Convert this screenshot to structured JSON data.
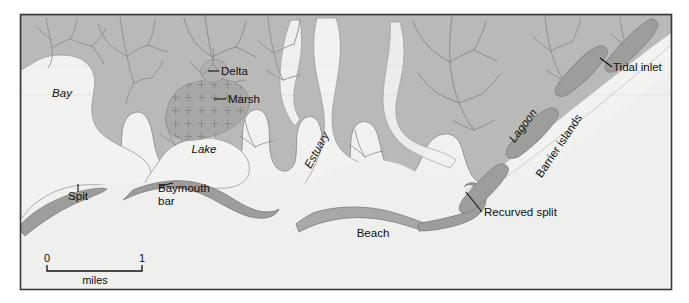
{
  "figure": {
    "frame": {
      "x": 20,
      "y": 14,
      "width": 652,
      "height": 276,
      "border_color": "#3a3a3a"
    }
  },
  "colors": {
    "water": "#f2f2f0",
    "land": "#b9b9b7",
    "land_edge": "#8e8e8c",
    "marsh": "#a4a4a2",
    "marsh_symbol": "#8a8a88",
    "bar_sand": "#9d9d9b",
    "bar_sand_edge": "#7e7e7c",
    "drainage": "#8d8d8b",
    "beach": "#a8a8a6",
    "label_text": "#101010",
    "leader_line": "#101010",
    "page_background": "#ffffff"
  },
  "labels": [
    {
      "id": "bay",
      "text": "Bay",
      "style": "italic",
      "x": 62,
      "y": 97,
      "rotate": 0,
      "anchor": "middle"
    },
    {
      "id": "lake",
      "text": "Lake",
      "style": "italic",
      "x": 204,
      "y": 153,
      "rotate": 0,
      "anchor": "middle"
    },
    {
      "id": "estuary",
      "text": "Estuary",
      "style": "italic",
      "x": 320,
      "y": 152,
      "rotate": -62,
      "anchor": "middle"
    },
    {
      "id": "lagoon",
      "text": "Lagoon",
      "style": "italic",
      "x": 526,
      "y": 128,
      "rotate": -53,
      "anchor": "middle"
    },
    {
      "id": "delta",
      "text": "Delta",
      "style": "regular",
      "x": 221,
      "y": 75,
      "rotate": 0,
      "anchor": "start"
    },
    {
      "id": "marsh",
      "text": "Marsh",
      "style": "regular",
      "x": 228,
      "y": 103,
      "rotate": 0,
      "anchor": "start"
    },
    {
      "id": "tidal-inlet",
      "text": "Tidal inlet",
      "style": "regular",
      "x": 613,
      "y": 71,
      "rotate": 0,
      "anchor": "start"
    },
    {
      "id": "barrier-islands",
      "text": "Barrier islands",
      "style": "regular",
      "x": 562,
      "y": 148,
      "rotate": -56,
      "anchor": "middle"
    },
    {
      "id": "recurved-split",
      "text": "Recurved split",
      "style": "regular",
      "x": 484,
      "y": 216,
      "rotate": 0,
      "anchor": "start"
    },
    {
      "id": "beach",
      "text": "Beach",
      "style": "regular",
      "x": 373,
      "y": 237,
      "rotate": 0,
      "anchor": "middle"
    },
    {
      "id": "spit",
      "text": "Spit",
      "style": "regular",
      "x": 78,
      "y": 200,
      "rotate": 0,
      "anchor": "middle"
    },
    {
      "id": "baymouth-bar-1",
      "text": "Baymouth",
      "style": "regular",
      "x": 158,
      "y": 192,
      "rotate": 0,
      "anchor": "start"
    },
    {
      "id": "baymouth-bar-2",
      "text": "bar",
      "style": "regular",
      "x": 158,
      "y": 205,
      "rotate": 0,
      "anchor": "start"
    }
  ],
  "scale_bar": {
    "start_label": "0",
    "end_label": "1",
    "unit_label": "miles",
    "x_start": 47,
    "x_end": 142,
    "y": 271,
    "tick_height": 6
  },
  "features": {
    "water_bodies": [
      "Bay",
      "Lake",
      "Estuary",
      "Lagoon"
    ],
    "landforms": [
      "Delta",
      "Marsh",
      "Spit",
      "Baymouth bar",
      "Barrier islands",
      "Tidal inlet",
      "Recurved split",
      "Beach"
    ]
  }
}
